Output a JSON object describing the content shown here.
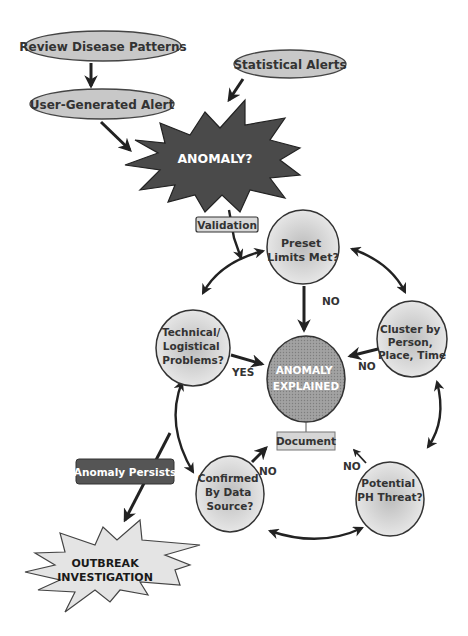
{
  "diagram": {
    "inputs": [
      {
        "id": "review",
        "label": "Review Disease Patterns"
      },
      {
        "id": "user_alert",
        "label": "User-Generated Alert"
      },
      {
        "id": "stat_alerts",
        "label": "Statistical Alerts"
      }
    ],
    "anomaly": {
      "label": "ANOMALY?"
    },
    "validation": {
      "label": "Validation"
    },
    "cycle_nodes": [
      {
        "id": "preset",
        "lines": [
          "Preset",
          "Limits Met?"
        ]
      },
      {
        "id": "cluster",
        "lines": [
          "Cluster by",
          "Person,",
          "Place, Time"
        ]
      },
      {
        "id": "threat",
        "lines": [
          "Potential",
          "PH Threat?"
        ]
      },
      {
        "id": "confirmed",
        "lines": [
          "Confirmed",
          "By Data",
          "Source?"
        ]
      },
      {
        "id": "technical",
        "lines": [
          "Technical/",
          "Logistical",
          "Problems?"
        ]
      }
    ],
    "center": {
      "lines": [
        "ANOMALY",
        "EXPLAINED"
      ]
    },
    "document": {
      "label": "Document"
    },
    "edge_labels": {
      "preset_to_center": "NO",
      "cluster_to_center": "NO",
      "technical_to_center": "YES",
      "confirmed_to_document": "NO",
      "threat_to_document": "NO"
    },
    "persists": {
      "label": "Anomaly Persists"
    },
    "outbreak": {
      "lines": [
        "OUTBREAK",
        "INVESTIGATION"
      ]
    }
  },
  "colors": {
    "ellipse_fill": "#c8c8c8",
    "burst_dark": "#4a4a4a",
    "circle_fill": "#e6e6e6",
    "center_fill": "#9a9a9a",
    "persists_fill": "#555555",
    "outbreak_fill": "#e4e4e4"
  }
}
